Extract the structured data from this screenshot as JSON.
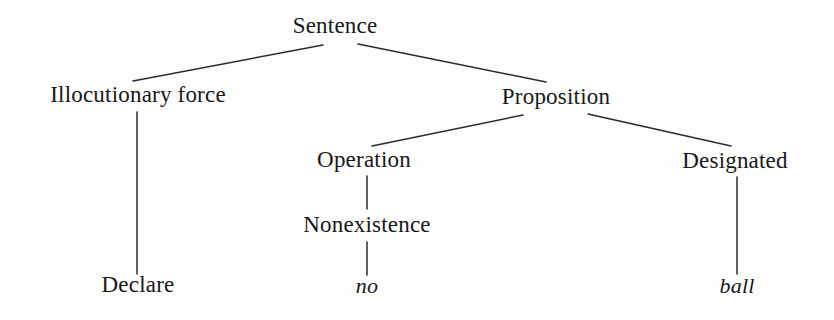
{
  "figure": {
    "kind": "syntactic-tree-diagram",
    "background_color": "#fdfdfc",
    "line_color": "#2b2b2b",
    "text_color": "#18181a"
  },
  "nodes": [
    {
      "id": "sentence",
      "label": "Sentence",
      "x": 335,
      "y": 28,
      "style": "roman",
      "level": 0
    },
    {
      "id": "illocutionaryforce",
      "label": "Illocutionary force",
      "x": 138,
      "y": 97,
      "style": "roman",
      "level": 1
    },
    {
      "id": "proposition",
      "label": "Proposition",
      "x": 556,
      "y": 99,
      "style": "roman",
      "level": 1
    },
    {
      "id": "operation",
      "label": "Operation",
      "x": 364,
      "y": 162,
      "style": "roman",
      "level": 2
    },
    {
      "id": "designated",
      "label": "Designated",
      "x": 735,
      "y": 163,
      "style": "roman",
      "level": 2
    },
    {
      "id": "nonexistence",
      "label": "Nonexistence",
      "x": 367,
      "y": 227,
      "style": "roman",
      "level": 3
    },
    {
      "id": "declare",
      "label": "Declare",
      "x": 138,
      "y": 287,
      "style": "roman",
      "level": 4
    },
    {
      "id": "no",
      "label": "no",
      "x": 367,
      "y": 288,
      "style": "italic",
      "level": 4
    },
    {
      "id": "ball",
      "label": "ball",
      "x": 737,
      "y": 288,
      "style": "italic",
      "level": 4
    }
  ],
  "edges": [
    {
      "id": "sentence-illocutionaryforce",
      "from": "sentence",
      "to": "illocutionaryforce",
      "x1": 323,
      "y1": 45,
      "x2": 133,
      "y2": 81
    },
    {
      "id": "sentence-proposition",
      "from": "sentence",
      "to": "proposition",
      "x1": 358,
      "y1": 44,
      "x2": 546,
      "y2": 82
    },
    {
      "id": "illocutionaryforce-declare",
      "from": "illocutionaryforce",
      "to": "declare",
      "x1": 137,
      "y1": 112,
      "x2": 137,
      "y2": 274
    },
    {
      "id": "proposition-operation",
      "from": "proposition",
      "to": "operation",
      "x1": 523,
      "y1": 115,
      "x2": 372,
      "y2": 146
    },
    {
      "id": "proposition-designated",
      "from": "proposition",
      "to": "designated",
      "x1": 588,
      "y1": 114,
      "x2": 731,
      "y2": 146
    },
    {
      "id": "operation-nonexistence",
      "from": "operation",
      "to": "nonexistence",
      "x1": 367,
      "y1": 176,
      "x2": 367,
      "y2": 209
    },
    {
      "id": "nonexistence-no",
      "from": "nonexistence",
      "to": "no",
      "x1": 367,
      "y1": 242,
      "x2": 367,
      "y2": 275
    },
    {
      "id": "designated-ball",
      "from": "designated",
      "to": "ball",
      "x1": 737,
      "y1": 177,
      "x2": 737,
      "y2": 274
    }
  ]
}
